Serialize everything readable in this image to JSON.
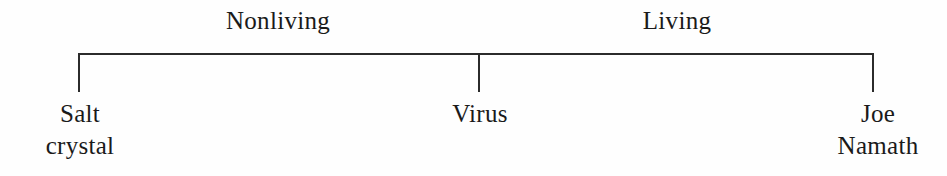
{
  "figure": {
    "name": "living-nonliving-continuum",
    "background_color": "#fefefe",
    "line_color": "#2b2b2b",
    "text_color": "#1a1a1a"
  },
  "categories": [
    {
      "label": "Nonliving",
      "center_x": 278
    },
    {
      "label": "Living",
      "center_x": 677
    }
  ],
  "endpoints": [
    {
      "name": "salt-crystal",
      "line1": "Salt",
      "line2": "crystal",
      "tick_x": 78
    },
    {
      "name": "virus",
      "line1": "Virus",
      "line2": "",
      "tick_x": 479
    },
    {
      "name": "joe-namath",
      "line1": "Joe",
      "line2": "Namath",
      "tick_x": 874
    }
  ],
  "rule": {
    "y": 54,
    "left_x": 78,
    "right_x": 874,
    "tick_bottom_y": 92,
    "stroke_width": 2
  }
}
